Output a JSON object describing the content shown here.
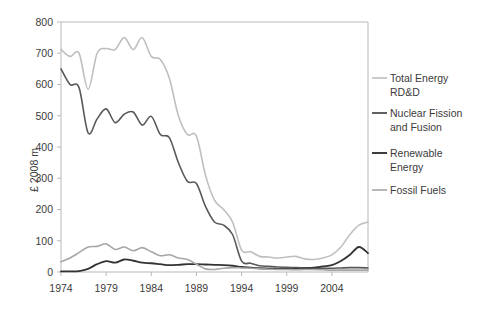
{
  "chart_data": {
    "type": "line",
    "title": "",
    "xlabel": "",
    "ylabel": "£ 2008 m",
    "xlim": [
      1974,
      2008
    ],
    "ylim": [
      0,
      800
    ],
    "grid": false,
    "legend_position": "right",
    "x": [
      1974,
      1975,
      1976,
      1977,
      1978,
      1979,
      1980,
      1981,
      1982,
      1983,
      1984,
      1985,
      1986,
      1987,
      1988,
      1989,
      1990,
      1991,
      1992,
      1993,
      1994,
      1995,
      1996,
      1997,
      1998,
      1999,
      2000,
      2001,
      2002,
      2003,
      2004,
      2005,
      2006,
      2007,
      2008
    ],
    "xticks": [
      1974,
      1979,
      1984,
      1989,
      1994,
      1999,
      2004
    ],
    "xtick_labels": [
      "1974",
      "1979",
      "1984",
      "1989",
      "1994",
      "1999",
      "2004"
    ],
    "yticks": [
      0,
      100,
      200,
      300,
      400,
      500,
      600,
      700,
      800
    ],
    "ytick_labels": [
      "0",
      "100",
      "200",
      "300",
      "400",
      "500",
      "600",
      "700",
      "800"
    ],
    "series": [
      {
        "name": "Total Energy RD&D",
        "color": "#bfbfbf",
        "width": 1.6,
        "values": [
          712,
          690,
          700,
          585,
          700,
          715,
          712,
          750,
          712,
          750,
          690,
          680,
          620,
          500,
          440,
          435,
          310,
          230,
          200,
          160,
          70,
          65,
          50,
          48,
          45,
          48,
          50,
          42,
          40,
          45,
          55,
          80,
          120,
          150,
          160
        ]
      },
      {
        "name": "Nuclear Fission and Fusion",
        "color": "#595959",
        "width": 1.6,
        "values": [
          650,
          600,
          590,
          445,
          490,
          522,
          478,
          505,
          512,
          470,
          498,
          440,
          430,
          350,
          290,
          283,
          210,
          160,
          150,
          120,
          35,
          28,
          20,
          18,
          16,
          15,
          14,
          13,
          12,
          12,
          12,
          13,
          14,
          14,
          13
        ]
      },
      {
        "name": "Renewable Energy",
        "color": "#333333",
        "width": 1.8,
        "values": [
          2,
          2,
          3,
          10,
          25,
          35,
          30,
          40,
          36,
          30,
          28,
          25,
          22,
          23,
          25,
          25,
          24,
          23,
          22,
          20,
          16,
          14,
          12,
          11,
          10,
          10,
          10,
          12,
          14,
          18,
          22,
          35,
          55,
          80,
          60
        ]
      },
      {
        "name": "Fossil Fuels",
        "color": "#a6a6a6",
        "width": 1.6,
        "values": [
          33,
          45,
          62,
          80,
          82,
          90,
          72,
          80,
          68,
          78,
          65,
          52,
          55,
          45,
          40,
          25,
          10,
          8,
          12,
          14,
          13,
          12,
          10,
          9,
          8,
          8,
          7,
          8,
          8,
          7,
          6,
          6,
          6,
          6,
          6
        ]
      }
    ]
  },
  "axis": {
    "y_title": "£ 2008 m"
  },
  "legend": {
    "entries": [
      {
        "label_line1": "Total Energy",
        "label_line2": "RD&D",
        "color": "#bfbfbf"
      },
      {
        "label_line1": "Nuclear Fission",
        "label_line2": "and Fusion",
        "color": "#595959"
      },
      {
        "label_line1": "Renewable",
        "label_line2": "Energy",
        "color": "#333333"
      },
      {
        "label_line1": "Fossil Fuels",
        "label_line2": "",
        "color": "#a6a6a6"
      }
    ]
  }
}
